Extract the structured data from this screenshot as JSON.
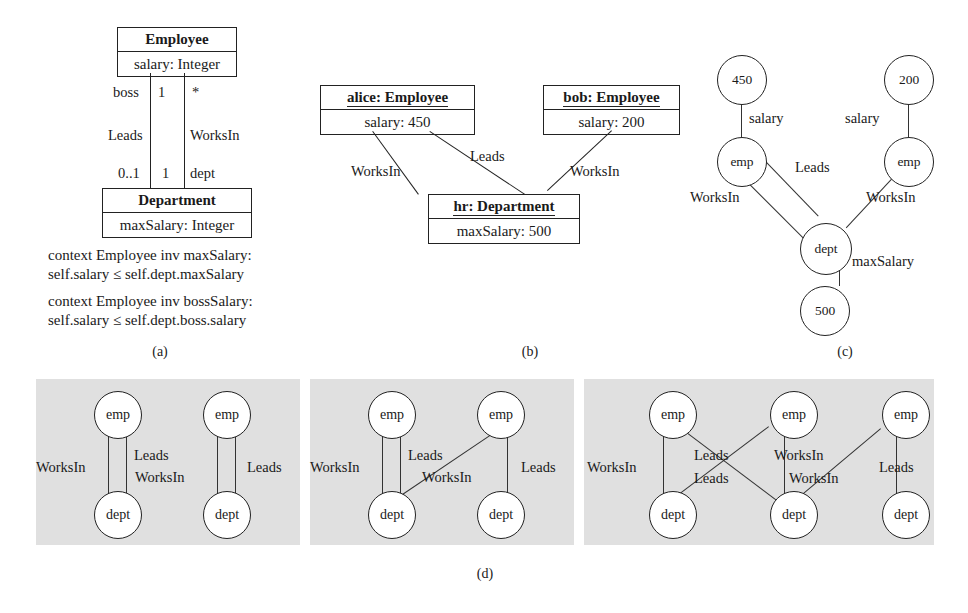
{
  "figure": {
    "caption_a": "(a)",
    "caption_b": "(b)",
    "caption_c": "(c)",
    "caption_d": "(d)"
  },
  "class_diagram": {
    "employee": {
      "name": "Employee",
      "attribute": "salary: Integer"
    },
    "department": {
      "name": "Department",
      "attribute": "maxSalary: Integer"
    },
    "associations": [
      {
        "name": "Leads",
        "end_upper_role": "boss",
        "end_upper_mult": "1",
        "end_lower_mult": "0..1"
      },
      {
        "name": "WorksIn",
        "end_upper_mult": "*",
        "end_lower_mult": "1",
        "end_lower_role": "dept"
      }
    ],
    "labels": {
      "boss": "boss",
      "one_upper": "1",
      "star": "*",
      "leads": "Leads",
      "worksin": "WorksIn",
      "zero_one": "0..1",
      "one_lower": "1",
      "dept": "dept"
    },
    "ocl": {
      "inv1_line1": "context Employee inv maxSalary:",
      "inv1_line2": "self.salary ≤ self.dept.maxSalary",
      "inv2_line1": "context Employee inv bossSalary:",
      "inv2_line2": "self.salary ≤ self.dept.boss.salary"
    }
  },
  "object_diagram": {
    "alice": {
      "name": "alice: Employee",
      "attribute": "salary: 450"
    },
    "bob": {
      "name": "bob: Employee",
      "attribute": "salary: 200"
    },
    "hr": {
      "name": "hr: Department",
      "attribute": "maxSalary: 500"
    },
    "links": [
      {
        "label": "WorksIn",
        "from": "alice",
        "to": "hr"
      },
      {
        "label": "Leads",
        "from": "alice",
        "to": "hr"
      },
      {
        "label": "WorksIn",
        "from": "bob",
        "to": "hr"
      }
    ],
    "labels": {
      "worksin_left": "WorksIn",
      "leads": "Leads",
      "worksin_right": "WorksIn"
    }
  },
  "graph_c": {
    "type": "graph",
    "nodes": [
      {
        "id": "v450",
        "label": "450"
      },
      {
        "id": "v200",
        "label": "200"
      },
      {
        "id": "emp1",
        "label": "emp"
      },
      {
        "id": "emp2",
        "label": "emp"
      },
      {
        "id": "dept",
        "label": "dept"
      },
      {
        "id": "v500",
        "label": "500"
      }
    ],
    "edges": [
      {
        "from": "v450",
        "to": "emp1",
        "label": "salary"
      },
      {
        "from": "v200",
        "to": "emp2",
        "label": "salary"
      },
      {
        "from": "emp1",
        "to": "dept",
        "label": "WorksIn"
      },
      {
        "from": "emp1",
        "to": "dept",
        "label": "Leads"
      },
      {
        "from": "emp2",
        "to": "dept",
        "label": "WorksIn"
      },
      {
        "from": "dept",
        "to": "v500",
        "label": "maxSalary"
      }
    ],
    "labels": {
      "salary_left": "salary",
      "salary_right": "salary",
      "leads": "Leads",
      "worksin_left": "WorksIn",
      "worksin_right": "WorksIn",
      "maxsalary": "maxSalary"
    }
  },
  "graphs_d": [
    {
      "id": "d1",
      "nodes": [
        {
          "id": "emp1",
          "label": "emp"
        },
        {
          "id": "emp2",
          "label": "emp"
        },
        {
          "id": "dept1",
          "label": "dept"
        },
        {
          "id": "dept2",
          "label": "dept"
        }
      ],
      "edges": [
        {
          "from": "emp1",
          "to": "dept1",
          "label": "WorksIn"
        },
        {
          "from": "emp1",
          "to": "dept1",
          "label": "Leads"
        },
        {
          "from": "emp2",
          "to": "dept2",
          "label": "WorksIn"
        },
        {
          "from": "emp2",
          "to": "dept2",
          "label": "Leads"
        }
      ],
      "labels": {
        "worksin_1": "WorksIn",
        "leads_1": "Leads",
        "worksin_2": "WorksIn",
        "leads_2": "Leads"
      }
    },
    {
      "id": "d2",
      "nodes": [
        {
          "id": "emp1",
          "label": "emp"
        },
        {
          "id": "emp2",
          "label": "emp"
        },
        {
          "id": "dept1",
          "label": "dept"
        },
        {
          "id": "dept2",
          "label": "dept"
        }
      ],
      "edges": [
        {
          "from": "emp1",
          "to": "dept1",
          "label": "WorksIn"
        },
        {
          "from": "emp1",
          "to": "dept1",
          "label": "Leads"
        },
        {
          "from": "emp2",
          "to": "dept1",
          "label": "WorksIn"
        },
        {
          "from": "emp2",
          "to": "dept2",
          "label": "Leads"
        }
      ],
      "labels": {
        "worksin_1": "WorksIn",
        "leads_1": "Leads",
        "worksin_2": "WorksIn",
        "leads_2": "Leads"
      }
    },
    {
      "id": "d3",
      "nodes": [
        {
          "id": "emp1",
          "label": "emp"
        },
        {
          "id": "emp2",
          "label": "emp"
        },
        {
          "id": "emp3",
          "label": "emp"
        },
        {
          "id": "dept1",
          "label": "dept"
        },
        {
          "id": "dept2",
          "label": "dept"
        },
        {
          "id": "dept3",
          "label": "dept"
        }
      ],
      "edges": [
        {
          "from": "emp1",
          "to": "dept1",
          "label": "WorksIn"
        },
        {
          "from": "emp1",
          "to": "dept2",
          "label": "Leads"
        },
        {
          "from": "emp2",
          "to": "dept1",
          "label": "Leads"
        },
        {
          "from": "emp2",
          "to": "dept2",
          "label": "WorksIn"
        },
        {
          "from": "emp3",
          "to": "dept2",
          "label": "WorksIn"
        },
        {
          "from": "emp3",
          "to": "dept3",
          "label": "Leads"
        }
      ],
      "labels": {
        "worksin_1": "WorksIn",
        "leads_1": "Leads",
        "leads_2": "Leads",
        "worksin_2": "WorksIn",
        "worksin_3": "WorksIn",
        "leads_3": "Leads"
      }
    }
  ],
  "colors": {
    "panel_background": "#e0e0e0",
    "line": "#222222",
    "text": "#1a1a1a",
    "page_background": "#ffffff"
  }
}
